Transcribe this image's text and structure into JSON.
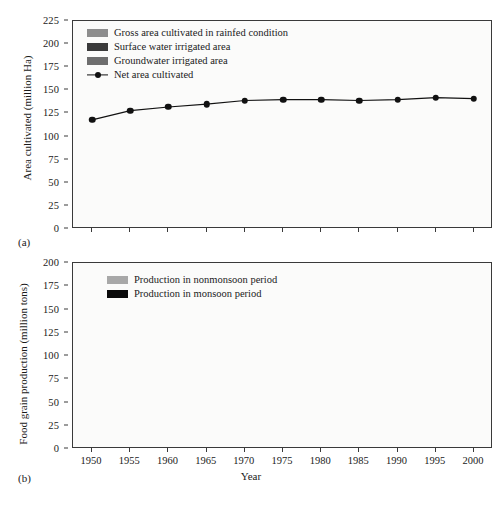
{
  "figure": {
    "panel_a_label": "(a)",
    "panel_b_label": "(b)"
  },
  "colors": {
    "rainfed": "#8d8d8d",
    "surface_water": "#3a3a3a",
    "groundwater": "#6e6e6e",
    "net_line": "#111111",
    "nonmonsoon": "#a8a8a8",
    "monsoon": "#0a0a0a",
    "axis": "#3a3a3a",
    "plot_background": "#fbfbfa"
  },
  "chart_data": [
    {
      "type": "bar",
      "id": "panel-a",
      "title": "",
      "xlabel": "",
      "ylabel": "Area cultivated (million Ha)",
      "categories": [
        "1950",
        "1955",
        "1960",
        "1965",
        "1970",
        "1975",
        "1980",
        "1985",
        "1990",
        "1995",
        "2000"
      ],
      "ylim": [
        0,
        225
      ],
      "yticks": [
        0,
        25,
        50,
        75,
        100,
        125,
        150,
        175,
        200,
        225
      ],
      "grid": false,
      "legend_position": "top-left",
      "stacked": true,
      "series": [
        {
          "name": "Groundwater irrigated area",
          "key": "groundwater",
          "color": "#6e6e6e",
          "values": [
            14,
            18,
            20,
            21,
            25,
            29,
            33,
            37,
            44,
            54,
            56
          ]
        },
        {
          "name": "Surface water irrigated area",
          "key": "surface_water",
          "color": "#3a3a3a",
          "values": [
            7,
            6,
            7,
            9,
            12,
            13,
            13,
            15,
            15,
            14,
            13
          ]
        },
        {
          "name": "Gross area cultivated in rainfed condition",
          "key": "rainfed",
          "color": "#8d8d8d",
          "values": [
            109,
            122,
            124,
            123,
            127,
            127,
            123,
            125,
            126,
            118,
            115
          ]
        }
      ],
      "overlay_series": {
        "name": "Net area cultivated",
        "type": "line",
        "marker": "circle",
        "color": "#111111",
        "values": [
          118,
          128,
          132,
          135,
          139,
          140,
          140,
          139,
          140,
          142,
          141
        ]
      },
      "bar_totals": [
        130,
        146,
        151,
        153,
        164,
        169,
        169,
        177,
        185,
        186,
        184
      ]
    },
    {
      "type": "bar",
      "id": "panel-b",
      "title": "",
      "xlabel": "Year",
      "ylabel": "Food grain production (million tons)",
      "categories": [
        "1950",
        "1955",
        "1960",
        "1965",
        "1970",
        "1975",
        "1980",
        "1985",
        "1990",
        "1995",
        "2000"
      ],
      "ylim": [
        0,
        200
      ],
      "yticks": [
        0,
        25,
        50,
        75,
        100,
        125,
        150,
        175,
        200
      ],
      "grid": false,
      "legend_position": "top-left",
      "stacked": true,
      "series": [
        {
          "name": "Production in monsoon period",
          "key": "monsoon",
          "color": "#0a0a0a",
          "values": [
            36,
            46,
            56,
            50,
            69,
            73,
            76,
            81,
            99,
            92,
            101
          ]
        },
        {
          "name": "Production in nonmonsoon period",
          "key": "nonmonsoon",
          "color": "#a8a8a8",
          "values": [
            15,
            21,
            24,
            22,
            36,
            46,
            51,
            67,
            78,
            88,
            95
          ]
        }
      ],
      "bar_totals": [
        51,
        67,
        80,
        72,
        105,
        119,
        127,
        148,
        177,
        180,
        196
      ]
    }
  ],
  "panel_a": {
    "ylabel": "Area cultivated (million Ha)",
    "legend": [
      {
        "label": "Gross area cultivated in rainfed condition",
        "type": "swatch",
        "color": "#8d8d8d"
      },
      {
        "label": "Surface water irrigated area",
        "type": "swatch",
        "color": "#3a3a3a"
      },
      {
        "label": "Groundwater irrigated area",
        "type": "swatch",
        "color": "#6e6e6e"
      },
      {
        "label": "Net area cultivated",
        "type": "line",
        "color": "#111111"
      }
    ],
    "yticks": [
      "225",
      "200",
      "175",
      "150",
      "125",
      "100",
      "75",
      "50",
      "25",
      "0"
    ]
  },
  "panel_b": {
    "ylabel": "Food grain production (million tons)",
    "xlabel": "Year",
    "legend": [
      {
        "label": "Production in nonmonsoon period",
        "type": "swatch",
        "color": "#a8a8a8"
      },
      {
        "label": "Production in monsoon period",
        "type": "swatch",
        "color": "#0a0a0a"
      }
    ],
    "yticks": [
      "200",
      "175",
      "150",
      "125",
      "100",
      "75",
      "50",
      "25",
      "0"
    ],
    "xticks": [
      "1950",
      "1955",
      "1960",
      "1965",
      "1970",
      "1975",
      "1980",
      "1985",
      "1990",
      "1995",
      "2000"
    ]
  }
}
